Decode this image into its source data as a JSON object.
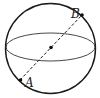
{
  "diagram": {
    "type": "sphere-with-diameter",
    "points": {
      "A": {
        "label": "A"
      },
      "B": {
        "label": "B"
      },
      "O": {
        "label": ""
      }
    },
    "colors": {
      "stroke": "#1a1a1a",
      "background": "#ffffff"
    }
  }
}
